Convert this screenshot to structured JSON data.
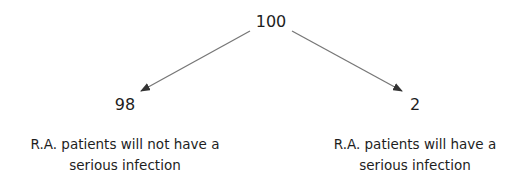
{
  "root": {
    "value": "100"
  },
  "branches": [
    {
      "value": "98",
      "line1": "R.A. patients will not have a",
      "line2": "serious infection"
    },
    {
      "value": "2",
      "line1": "R.A. patients will have a",
      "line2": "serious infection"
    }
  ],
  "colors": {
    "arrow": "#777777",
    "text": "#1e1e1e"
  }
}
